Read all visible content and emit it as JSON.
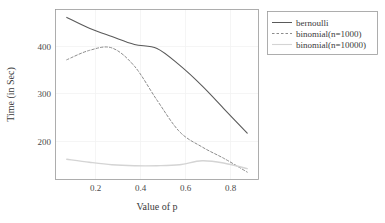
{
  "chart_data": {
    "type": "line",
    "title": "",
    "xlabel": "Value of p",
    "ylabel": "Time (in Sec)",
    "xlim": [
      0.05,
      0.95
    ],
    "ylim": [
      130,
      475
    ],
    "xticks": [
      0.2,
      0.4,
      0.6,
      0.8
    ],
    "xticklabels": [
      "0.2",
      "0.4",
      "0.6",
      "0.8"
    ],
    "yticks": [
      200,
      300,
      400
    ],
    "yticklabels": [
      "200",
      "300",
      "400"
    ],
    "grid": true,
    "legend_position": "right",
    "x": [
      0.1,
      0.2,
      0.3,
      0.4,
      0.5,
      0.6,
      0.7,
      0.8,
      0.9
    ],
    "series": [
      {
        "name": "bernoulli",
        "style": "solid",
        "color": "#5a5a5a",
        "values": [
          459,
          437,
          420,
          404,
          396,
          362,
          320,
          272,
          224
        ]
      },
      {
        "name": "binomial(n=1000)",
        "style": "dashed",
        "color": "#8c8c8c",
        "values": [
          373,
          392,
          397,
          360,
          291,
          227,
          196,
          172,
          145
        ]
      },
      {
        "name": "binomial(n=10000)",
        "style": "solid",
        "color": "#d4d4d4",
        "values": [
          171,
          165,
          160,
          158,
          158,
          160,
          168,
          163,
          152
        ]
      }
    ]
  },
  "axes": {
    "x_title": "Value of p",
    "y_title": "Time (in Sec)",
    "x_tick_labels": [
      "0.2",
      "0.4",
      "0.6",
      "0.8"
    ],
    "y_tick_labels": [
      "200",
      "300",
      "400"
    ]
  },
  "legend": {
    "entries": [
      {
        "label": "bernoulli",
        "style": "solid",
        "color": "#5a5a5a"
      },
      {
        "label": "binomial(n=1000)",
        "style": "dashed",
        "color": "#8c8c8c"
      },
      {
        "label": "binomial(n=10000)",
        "style": "solid",
        "color": "#d4d4d4"
      }
    ]
  },
  "colors": {
    "panel_border": "#9a9a9a",
    "gridline": "#f2f2f2",
    "background": "#ffffff",
    "text": "#3b3b3b"
  }
}
